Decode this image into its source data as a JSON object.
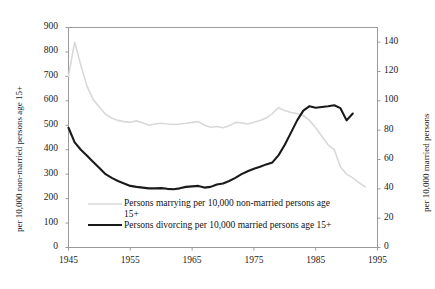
{
  "chart_data": {
    "type": "line",
    "title": "",
    "xlabel": "",
    "ylabel": "per 10,000 non-married persons age 15+",
    "ylabel_right": "per 10,000 married persons",
    "xlim": [
      1945,
      1995
    ],
    "ylim": [
      0,
      900
    ],
    "ylim_right": [
      0,
      150
    ],
    "grid": false,
    "legend_position": "inside-bottom-left",
    "xticks": [
      "1945",
      "1955",
      "1965",
      "1975",
      "1985",
      "1995"
    ],
    "xtick_values": [
      1945,
      1955,
      1965,
      1975,
      1985,
      1995
    ],
    "yticks_left": [
      "0",
      "100",
      "200",
      "300",
      "400",
      "500",
      "600",
      "700",
      "800",
      "900"
    ],
    "ytick_values_left": [
      0,
      100,
      200,
      300,
      400,
      500,
      600,
      700,
      800,
      900
    ],
    "yticks_right": [
      "0",
      "20",
      "40",
      "60",
      "80",
      "100",
      "120",
      "140"
    ],
    "ytick_values_right": [
      0,
      20,
      40,
      60,
      80,
      100,
      120,
      140
    ],
    "series": [
      {
        "name": "Persons marrying per 10,000 non-married persons age 15+",
        "color": "#d9d9d9",
        "axis": "left",
        "x": [
          1945,
          1946,
          1947,
          1948,
          1949,
          1950,
          1951,
          1952,
          1953,
          1954,
          1955,
          1956,
          1957,
          1958,
          1959,
          1960,
          1961,
          1962,
          1963,
          1964,
          1965,
          1966,
          1967,
          1968,
          1969,
          1970,
          1971,
          1972,
          1973,
          1974,
          1975,
          1976,
          1977,
          1978,
          1979,
          1980,
          1981,
          1982,
          1983,
          1984,
          1985,
          1986,
          1987,
          1988,
          1989,
          1990,
          1991,
          1992,
          1993
        ],
        "values": [
          700,
          840,
          745,
          660,
          605,
          575,
          545,
          530,
          520,
          515,
          512,
          518,
          510,
          500,
          505,
          508,
          505,
          503,
          505,
          508,
          512,
          515,
          500,
          492,
          495,
          490,
          498,
          512,
          510,
          505,
          512,
          520,
          530,
          548,
          572,
          560,
          552,
          548,
          540,
          520,
          490,
          455,
          420,
          400,
          330,
          300,
          285,
          265,
          248
        ]
      },
      {
        "name": "Persons divorcing per 10,000 married persons age 15+",
        "color": "#1a1a1a",
        "axis": "left",
        "x": [
          1945,
          1946,
          1947,
          1948,
          1949,
          1950,
          1951,
          1952,
          1953,
          1954,
          1955,
          1956,
          1957,
          1958,
          1959,
          1960,
          1961,
          1962,
          1963,
          1964,
          1965,
          1966,
          1967,
          1968,
          1969,
          1970,
          1971,
          1972,
          1973,
          1974,
          1975,
          1976,
          1977,
          1978,
          1979,
          1980,
          1981,
          1982,
          1983,
          1984,
          1985,
          1986,
          1987,
          1988,
          1989,
          1990,
          1991
        ],
        "values": [
          490,
          430,
          400,
          375,
          350,
          325,
          300,
          285,
          272,
          262,
          252,
          248,
          245,
          242,
          242,
          243,
          240,
          238,
          242,
          248,
          250,
          252,
          245,
          248,
          258,
          262,
          272,
          285,
          300,
          312,
          322,
          330,
          340,
          348,
          378,
          420,
          470,
          520,
          560,
          578,
          572,
          575,
          578,
          582,
          570,
          520,
          548
        ]
      }
    ],
    "annotations": []
  },
  "legend": {
    "entries": [
      {
        "label_line1": "Persons marrying per 10,000 non-married persons age",
        "label_line2": "15+",
        "color": "#d9d9d9"
      },
      {
        "label_line1": "Persons divorcing per 10,000 married persons age 15+",
        "label_line2": "",
        "color": "#1a1a1a"
      }
    ]
  }
}
